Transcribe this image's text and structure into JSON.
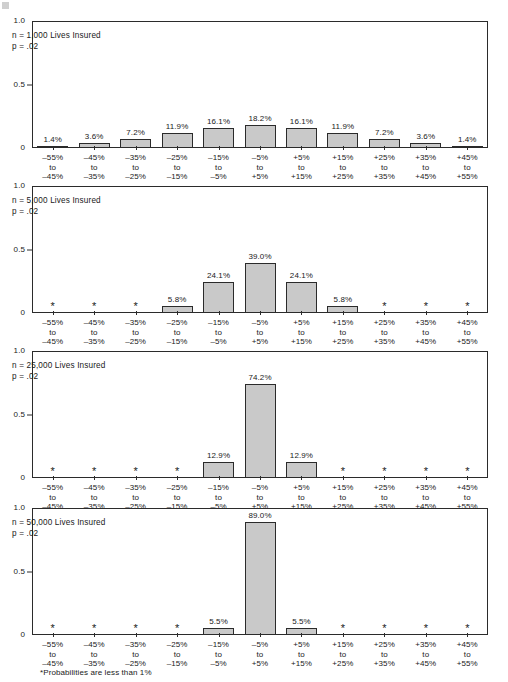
{
  "figure": {
    "footnote": "*Probabilities are less than 1%",
    "bar_fill": "#c9c9c9",
    "bar_stroke": "#2b2b2b",
    "frame_color": "#2b2b2b",
    "background": "#ffffff"
  },
  "chart_data": {
    "type": "bar",
    "title": "",
    "subtitle": "",
    "xlabel": "",
    "ylabel": "",
    "ylim": [
      0,
      1.0
    ],
    "yticks": [
      "0",
      "0.5",
      "1.0"
    ],
    "ytick_values": [
      0,
      0.5,
      1.0
    ],
    "grid": false,
    "legend": "none",
    "below_threshold_marker": "*",
    "categories": [
      "-55%\nto\n-45%",
      "-45%\nto\n-35%",
      "-35%\nto\n-25%",
      "-25%\nto\n-15%",
      "-15%\nto\n-5%",
      "-5%\nto\n+5%",
      "+5%\nto\n+15%",
      "+15%\nto\n+25%",
      "+25%\nto\n+35%",
      "+35%\nto\n+45%",
      "+45%\nto\n+55%"
    ],
    "category_lines": [
      [
        "–55%",
        "to",
        "–45%"
      ],
      [
        "–45%",
        "to",
        "–35%"
      ],
      [
        "–35%",
        "to",
        "–25%"
      ],
      [
        "–25%",
        "to",
        "–15%"
      ],
      [
        "–15%",
        "to",
        "–5%"
      ],
      [
        "–5%",
        "to",
        "+5%"
      ],
      [
        "+5%",
        "to",
        "+15%"
      ],
      [
        "+15%",
        "to",
        "+25%"
      ],
      [
        "+25%",
        "to",
        "+35%"
      ],
      [
        "+35%",
        "to",
        "+45%"
      ],
      [
        "+45%",
        "to",
        "+55%"
      ]
    ],
    "panels": [
      {
        "id": "panel-1000",
        "note_n": "n = 1,000 Lives Insured",
        "note_p": "p = .02",
        "values": [
          0.014,
          0.036,
          0.072,
          0.119,
          0.161,
          0.182,
          0.161,
          0.119,
          0.072,
          0.036,
          0.014
        ],
        "labels": [
          "1.4%",
          "3.6%",
          "7.2%",
          "11.9%",
          "16.1%",
          "18.2%",
          "16.1%",
          "11.9%",
          "7.2%",
          "3.6%",
          "1.4%"
        ]
      },
      {
        "id": "panel-5000",
        "note_n": "n = 5,000 Lives Insured",
        "note_p": "p = .02",
        "values": [
          0,
          0,
          0,
          0.058,
          0.241,
          0.39,
          0.241,
          0.058,
          0,
          0,
          0
        ],
        "labels": [
          "*",
          "*",
          "*",
          "5.8%",
          "24.1%",
          "39.0%",
          "24.1%",
          "5.8%",
          "*",
          "*",
          "*"
        ]
      },
      {
        "id": "panel-25000",
        "note_n": "n = 25,000 Lives Insured",
        "note_p": "p = .02",
        "values": [
          0,
          0,
          0,
          0,
          0.129,
          0.742,
          0.129,
          0,
          0,
          0,
          0
        ],
        "labels": [
          "*",
          "*",
          "*",
          "*",
          "12.9%",
          "74.2%",
          "12.9%",
          "*",
          "*",
          "*",
          "*"
        ]
      },
      {
        "id": "panel-50000",
        "note_n": "n = 50,000 Lives Insured",
        "note_p": "p = .02",
        "values": [
          0,
          0,
          0,
          0,
          0.055,
          0.89,
          0.055,
          0,
          0,
          0,
          0
        ],
        "labels": [
          "*",
          "*",
          "*",
          "*",
          "5.5%",
          "89.0%",
          "5.5%",
          "*",
          "*",
          "*",
          "*"
        ]
      }
    ]
  }
}
